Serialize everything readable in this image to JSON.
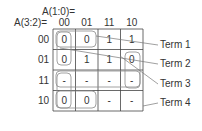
{
  "kmap": {
    "col_var_label": "A(1:0)=",
    "row_var_label": "A(3:2)=",
    "col_headers": [
      "00",
      "01",
      "11",
      "10"
    ],
    "row_headers": [
      "00",
      "01",
      "11",
      "10"
    ],
    "cells": [
      [
        "0",
        "0",
        "1",
        "1"
      ],
      [
        "0",
        "1",
        "1",
        "0"
      ],
      [
        "-",
        "-",
        "-",
        "-"
      ],
      [
        "0",
        "0",
        "-",
        "-"
      ]
    ]
  },
  "terms": [
    "Term 1",
    "Term 2",
    "Term 3",
    "Term 4"
  ],
  "colors": {
    "grid": "#444444",
    "loop": "#888888",
    "text": "#333333",
    "leader": "#777777"
  }
}
